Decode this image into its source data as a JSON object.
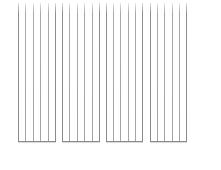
{
  "figure": {
    "line_color": "#a4a4a4",
    "edge_color": "#8a8a8a",
    "background": "#ffffff",
    "groups": [
      {
        "left": 18,
        "width": 38,
        "lines": 6
      },
      {
        "left": 62,
        "width": 38,
        "lines": 6
      },
      {
        "left": 106,
        "width": 37,
        "lines": 6
      },
      {
        "left": 150,
        "width": 37,
        "lines": 6
      }
    ]
  }
}
